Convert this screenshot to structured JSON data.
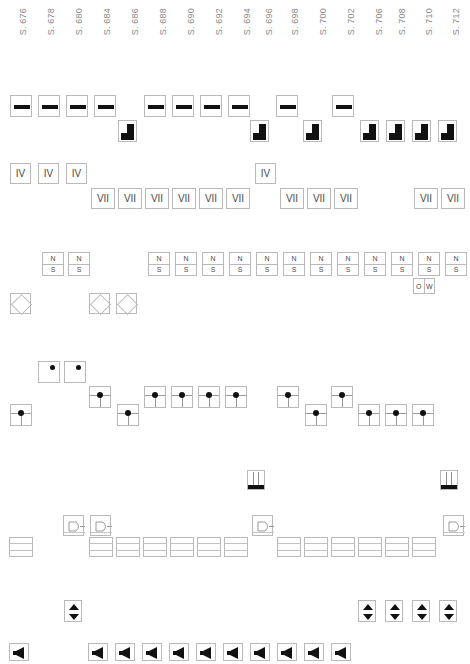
{
  "page": {
    "width": 470,
    "height": 664,
    "background": "#ffffff",
    "border_color": "#b9b9b9",
    "glyph_color": "#111111",
    "label_color": "#8a8a8a"
  },
  "columns": [
    {
      "label": "S. 676",
      "x": 18
    },
    {
      "label": "S. 678",
      "x": 46
    },
    {
      "label": "S. 680",
      "x": 74
    },
    {
      "label": "S. 684",
      "x": 102
    },
    {
      "label": "S. 686",
      "x": 130
    },
    {
      "label": "S. 688",
      "x": 158
    },
    {
      "label": "S. 690",
      "x": 186
    },
    {
      "label": "S. 692",
      "x": 214
    },
    {
      "label": "S. 694",
      "x": 242
    },
    {
      "label": "S. 696",
      "x": 264
    },
    {
      "label": "S. 698",
      "x": 290
    },
    {
      "label": "S. 700",
      "x": 318
    },
    {
      "label": "S. 702",
      "x": 346
    },
    {
      "label": "S. 706",
      "x": 374
    },
    {
      "label": "S. 708",
      "x": 397
    },
    {
      "label": "S. 710",
      "x": 424
    },
    {
      "label": "S. 712",
      "x": 451
    }
  ],
  "rows": [
    {
      "name": "dash-row",
      "symbol": "dash",
      "y": 95,
      "items": [
        {
          "x": 10
        },
        {
          "x": 38
        },
        {
          "x": 66
        },
        {
          "x": 94
        },
        {
          "x": 144
        },
        {
          "x": 172
        },
        {
          "x": 200
        },
        {
          "x": 228
        },
        {
          "x": 276
        },
        {
          "x": 332
        }
      ]
    },
    {
      "name": "step-row",
      "symbol": "step",
      "y": 120,
      "items": [
        {
          "x": 118
        },
        {
          "x": 250
        },
        {
          "x": 303
        },
        {
          "x": 360
        },
        {
          "x": 386
        },
        {
          "x": 412
        },
        {
          "x": 438
        }
      ]
    },
    {
      "name": "iv-row",
      "symbol": "text",
      "text": "IV",
      "y": 163,
      "items": [
        {
          "x": 10
        },
        {
          "x": 38
        },
        {
          "x": 66
        },
        {
          "x": 255
        }
      ]
    },
    {
      "name": "vii-row",
      "symbol": "text",
      "text": "VII",
      "y": 188,
      "items": [
        {
          "x": 91
        },
        {
          "x": 118
        },
        {
          "x": 145
        },
        {
          "x": 172
        },
        {
          "x": 199
        },
        {
          "x": 226
        },
        {
          "x": 280
        },
        {
          "x": 307
        },
        {
          "x": 334
        },
        {
          "x": 414
        },
        {
          "x": 441
        }
      ]
    },
    {
      "name": "ns-row",
      "symbol": "ns",
      "top": "N",
      "bottom": "S",
      "y": 252,
      "items": [
        {
          "x": 42
        },
        {
          "x": 68
        },
        {
          "x": 148
        },
        {
          "x": 175
        },
        {
          "x": 202
        },
        {
          "x": 229
        },
        {
          "x": 256
        },
        {
          "x": 283
        },
        {
          "x": 310
        },
        {
          "x": 337
        },
        {
          "x": 364
        },
        {
          "x": 391
        },
        {
          "x": 418
        },
        {
          "x": 445
        }
      ]
    },
    {
      "name": "ow-row",
      "symbol": "ow",
      "left": "O",
      "right": "W",
      "y": 278,
      "items": [
        {
          "x": 413
        }
      ]
    },
    {
      "name": "diamond-row",
      "symbol": "diamond",
      "y": 293,
      "items": [
        {
          "x": 10
        },
        {
          "x": 89
        },
        {
          "x": 116
        }
      ]
    },
    {
      "name": "dot-corner-row",
      "symbol": "dot-corner",
      "y": 361,
      "items": [
        {
          "x": 38
        },
        {
          "x": 64
        }
      ]
    },
    {
      "name": "dot-center-row",
      "symbol": "dot-center",
      "y": 386,
      "items": [
        {
          "x": 89
        },
        {
          "x": 144
        },
        {
          "x": 171
        },
        {
          "x": 198
        },
        {
          "x": 225
        },
        {
          "x": 277
        },
        {
          "x": 331
        }
      ]
    },
    {
      "name": "dot-center-row-2",
      "symbol": "dot-center",
      "y": 404,
      "items": [
        {
          "x": 10
        },
        {
          "x": 117
        },
        {
          "x": 305
        },
        {
          "x": 358
        },
        {
          "x": 385
        },
        {
          "x": 412
        }
      ]
    },
    {
      "name": "strip-row",
      "symbol": "strip",
      "y": 470,
      "items": [
        {
          "x": 247
        },
        {
          "x": 440
        }
      ]
    },
    {
      "name": "gate-row",
      "symbol": "gate",
      "y": 515,
      "items": [
        {
          "x": 63
        },
        {
          "x": 90
        },
        {
          "x": 252
        },
        {
          "x": 443
        }
      ]
    },
    {
      "name": "stack-row",
      "symbol": "stack",
      "y": 537,
      "items": [
        {
          "x": 9
        },
        {
          "x": 89
        },
        {
          "x": 116
        },
        {
          "x": 143
        },
        {
          "x": 170
        },
        {
          "x": 197
        },
        {
          "x": 224
        },
        {
          "x": 277
        },
        {
          "x": 304
        },
        {
          "x": 331
        },
        {
          "x": 358
        },
        {
          "x": 385
        },
        {
          "x": 412
        }
      ]
    },
    {
      "name": "updown-row",
      "symbol": "updown",
      "y": 600,
      "items": [
        {
          "x": 64
        },
        {
          "x": 358
        },
        {
          "x": 385
        },
        {
          "x": 412
        },
        {
          "x": 439
        }
      ]
    },
    {
      "name": "speaker-row",
      "symbol": "speaker",
      "y": 643,
      "items": [
        {
          "x": 9
        },
        {
          "x": 88
        },
        {
          "x": 115
        },
        {
          "x": 142
        },
        {
          "x": 169
        },
        {
          "x": 196
        },
        {
          "x": 223
        },
        {
          "x": 250
        },
        {
          "x": 277
        },
        {
          "x": 304
        },
        {
          "x": 331
        }
      ]
    }
  ]
}
